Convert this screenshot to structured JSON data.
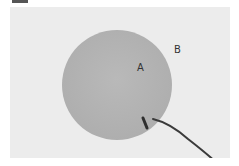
{
  "figure": {
    "labels": {
      "a": "A",
      "b": "B"
    },
    "colors": {
      "background": "#ececec",
      "disc": "#b4b4b4",
      "probe": "#3a3a3a"
    }
  }
}
